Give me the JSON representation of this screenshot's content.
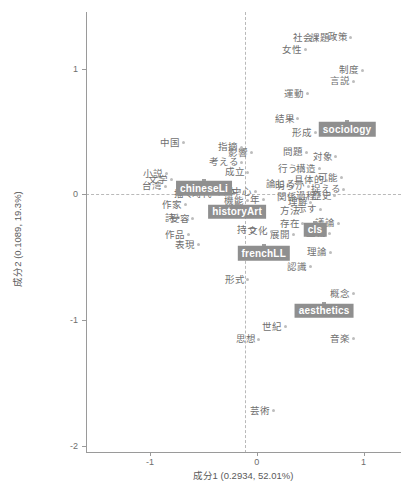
{
  "chart_data": {
    "type": "scatter",
    "title": "",
    "xlabel": "成分1  (0.2934,  52.01%)",
    "ylabel": "成分2  (0.1089,  19.3%)",
    "xlim": [
      -1.6,
      1.35
    ],
    "ylim": [
      -2.05,
      1.45
    ],
    "xticks": [
      -1,
      0,
      1
    ],
    "xticklabels": [
      "-1",
      "0",
      "1"
    ],
    "yticks": [
      1,
      0,
      -1,
      -2
    ],
    "yticklabels": [
      "1",
      "0",
      "-1",
      "-2"
    ],
    "grid": false,
    "legend": "none",
    "zero_reference_lines": true,
    "annotations": "Correspondence-analysis biplot of Japanese terms with field labels",
    "points": [
      {
        "label": "社会",
        "x": 0.555,
        "y": 1.245
      },
      {
        "label": "課題",
        "x": 0.715,
        "y": 1.245
      },
      {
        "label": "政策",
        "x": 0.88,
        "y": 1.25
      },
      {
        "label": "女性",
        "x": 0.455,
        "y": 1.15
      },
      {
        "label": "制度",
        "x": 0.985,
        "y": 0.985
      },
      {
        "label": "言説",
        "x": 0.905,
        "y": 0.9
      },
      {
        "label": "運動",
        "x": 0.47,
        "y": 0.8
      },
      {
        "label": "結果",
        "x": 0.385,
        "y": 0.6
      },
      {
        "label": "形成",
        "x": 0.545,
        "y": 0.49
      },
      {
        "label": "問題",
        "x": 0.465,
        "y": 0.335
      },
      {
        "label": "対象",
        "x": 0.74,
        "y": 0.3
      },
      {
        "label": "構造",
        "x": 0.585,
        "y": 0.205
      },
      {
        "label": "行う",
        "x": 0.415,
        "y": 0.2
      },
      {
        "label": "具体的",
        "x": 0.655,
        "y": 0.11
      },
      {
        "label": "可能",
        "x": 0.79,
        "y": 0.13
      },
      {
        "label": "明らか",
        "x": 0.48,
        "y": 0.065
      },
      {
        "label": "捉える",
        "x": 0.81,
        "y": 0.04
      },
      {
        "label": "論じる",
        "x": 0.395,
        "y": 0.085
      },
      {
        "label": "過程",
        "x": 0.585,
        "y": -0.01
      },
      {
        "label": "歴史",
        "x": 0.73,
        "y": -0.01
      },
      {
        "label": "関係",
        "x": 0.41,
        "y": -0.02
      },
      {
        "label": "理解",
        "x": 0.505,
        "y": -0.065
      },
      {
        "label": "示す",
        "x": 0.595,
        "y": -0.12
      },
      {
        "label": "方法",
        "x": 0.43,
        "y": -0.135
      },
      {
        "label": "存在",
        "x": 0.43,
        "y": -0.235
      },
      {
        "label": "議論",
        "x": 0.76,
        "y": -0.23
      },
      {
        "label": "主義",
        "x": 0.68,
        "y": -0.31
      },
      {
        "label": "展開",
        "x": 0.345,
        "y": -0.32
      },
      {
        "label": "理論",
        "x": 0.69,
        "y": -0.46
      },
      {
        "label": "認識",
        "x": 0.5,
        "y": -0.575
      },
      {
        "label": "概念",
        "x": 0.905,
        "y": -0.79
      },
      {
        "label": "音楽",
        "x": 0.905,
        "y": -1.15
      },
      {
        "label": "芸術",
        "x": 0.155,
        "y": -1.72
      },
      {
        "label": "世紀",
        "x": 0.265,
        "y": -1.055
      },
      {
        "label": "思想",
        "x": 0.02,
        "y": -1.155
      },
      {
        "label": "形式",
        "x": -0.085,
        "y": -0.68
      },
      {
        "label": "文化",
        "x": 0.135,
        "y": -0.295
      },
      {
        "label": "持つ",
        "x": 0.035,
        "y": -0.285
      },
      {
        "label": "当時",
        "x": 0.04,
        "y": -0.145
      },
      {
        "label": "年",
        "x": 0.06,
        "y": -0.045
      },
      {
        "label": "中心",
        "x": -0.015,
        "y": 0.02
      },
      {
        "label": "機能",
        "x": -0.09,
        "y": -0.05
      },
      {
        "label": "日本",
        "x": -0.16,
        "y": 0.02
      },
      {
        "label": "成立",
        "x": -0.085,
        "y": 0.175
      },
      {
        "label": "考える",
        "x": -0.145,
        "y": 0.255
      },
      {
        "label": "影響",
        "x": -0.05,
        "y": 0.33
      },
      {
        "label": "指摘",
        "x": -0.145,
        "y": 0.375
      },
      {
        "label": "見る",
        "x": -0.315,
        "y": 0.03
      },
      {
        "label": "時代",
        "x": -0.39,
        "y": 0.005
      },
      {
        "label": "映画",
        "x": -0.45,
        "y": 0.065
      },
      {
        "label": "描く",
        "x": -0.56,
        "y": 0.0
      },
      {
        "label": "作家",
        "x": -0.67,
        "y": -0.085
      },
      {
        "label": "詩",
        "x": -0.73,
        "y": -0.185
      },
      {
        "label": "受容",
        "x": -0.6,
        "y": -0.195
      },
      {
        "label": "作品",
        "x": -0.64,
        "y": -0.32
      },
      {
        "label": "表現",
        "x": -0.55,
        "y": -0.4
      },
      {
        "label": "文学",
        "x": -0.8,
        "y": 0.115
      },
      {
        "label": "小説",
        "x": -0.85,
        "y": 0.165
      },
      {
        "label": "台湾",
        "x": -0.855,
        "y": 0.065
      },
      {
        "label": "中国",
        "x": -0.69,
        "y": 0.41
      }
    ],
    "groups": [
      {
        "label": "sociology",
        "x": 0.845,
        "y": 0.575
      },
      {
        "label": "chineseLi",
        "x": -0.495,
        "y": 0.105
      },
      {
        "label": "historyArt",
        "x": -0.185,
        "y": -0.085
      },
      {
        "label": "cls",
        "x": 0.545,
        "y": -0.225
      },
      {
        "label": "frenchLL",
        "x": 0.065,
        "y": -0.415
      },
      {
        "label": "aesthetics",
        "x": 0.63,
        "y": -0.87
      }
    ]
  }
}
